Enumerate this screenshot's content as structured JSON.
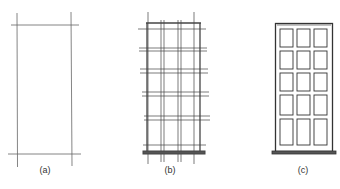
{
  "figure": {
    "panels": [
      {
        "id": "a",
        "label": "(a)",
        "description": "Construction lines: two vertical and two horizontal guide lines forming a tall rectangle"
      },
      {
        "id": "b",
        "label": "(b)",
        "description": "Grid of construction lines blocking in frame, mullions and rails"
      },
      {
        "id": "c",
        "label": "(c)",
        "description": "Finished door with 3 x 5 panels and sill"
      }
    ],
    "panel_c_grid": {
      "columns": 3,
      "rows": 5
    },
    "colors": {
      "line": "#555555",
      "dark_line": "#333333",
      "background": "#ffffff"
    }
  }
}
